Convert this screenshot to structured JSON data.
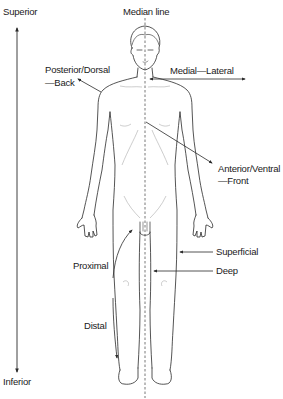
{
  "diagram": {
    "labels": {
      "superior": "Superior",
      "inferior": "Inferior",
      "median_line": "Median line",
      "posterior_line1": "Posterior/Dorsal",
      "posterior_line2": "—Back",
      "medial_lateral": "Medial—Lateral",
      "anterior_line1": "Anterior/Ventral",
      "anterior_line2": "—Front",
      "superficial": "Superficial",
      "deep": "Deep",
      "proximal": "Proximal",
      "distal": "Distal"
    },
    "colors": {
      "line": "#2a2a2a",
      "text": "#1a1a1a",
      "faint": "#9a9a9a",
      "background": "#ffffff"
    }
  }
}
